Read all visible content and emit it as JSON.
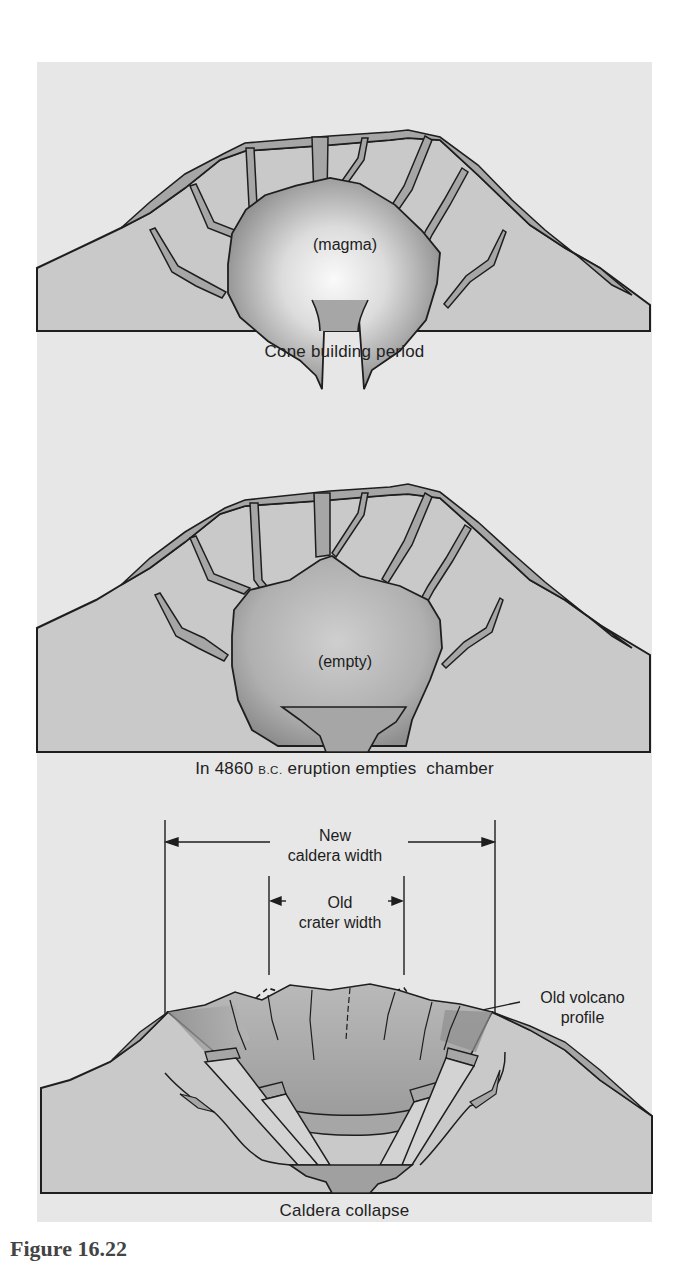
{
  "figure": {
    "caption_partial": "Figure 16.22",
    "colors": {
      "page_bg": "#ffffff",
      "panel_bg": "#e7e7e7",
      "ground": "#c9c9c9",
      "dike_fill": "#a9a9a9",
      "outline": "#1e1e1e",
      "magma_center": "#f7f7f7",
      "magma_edge": "#8f8f8f",
      "conduit": "#a0a0a0"
    }
  },
  "panels": [
    {
      "id": "cone",
      "chamber_label": "(magma)",
      "caption": "Cone building period"
    },
    {
      "id": "empty",
      "chamber_label": "(empty)",
      "caption_prefix": "In 4860 ",
      "caption_era": "B.C.",
      "caption_suffix": " eruption empties  chamber"
    },
    {
      "id": "collapse",
      "caption": "Caldera collapse",
      "annotations": {
        "new_caldera_line1": "New",
        "new_caldera_line2": "caldera width",
        "old_crater_line1": "Old",
        "old_crater_line2": "crater width",
        "old_profile_line1": "Old volcano",
        "old_profile_line2": "profile"
      }
    }
  ]
}
